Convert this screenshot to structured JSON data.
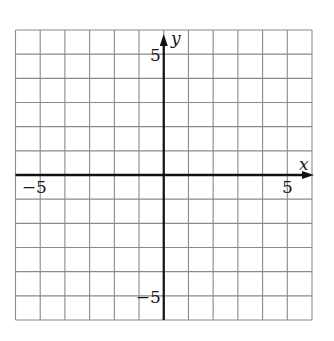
{
  "chart_data": {
    "type": "line",
    "title": "",
    "xlabel": "x",
    "ylabel": "y",
    "xlim": [
      -6,
      6
    ],
    "ylim": [
      -6,
      6
    ],
    "grid": true,
    "grid_step": 1,
    "x_tick_labels": [
      {
        "value": -5,
        "label": "−5"
      },
      {
        "value": 5,
        "label": "5"
      }
    ],
    "y_tick_labels": [
      {
        "value": 5,
        "label": "5"
      },
      {
        "value": -5,
        "label": "−5"
      }
    ],
    "series": [],
    "legend": null
  },
  "colors": {
    "grid": "#8a8a8a",
    "axis": "#111111",
    "background": "#ffffff"
  }
}
